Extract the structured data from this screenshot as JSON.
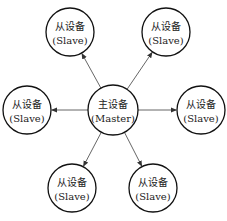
{
  "diagram": {
    "type": "star-topology",
    "master": {
      "label_cn": "主设备",
      "label_en": "(Master)",
      "cx": 113,
      "cy": 110,
      "r": 25
    },
    "slaves": [
      {
        "label_cn": "从设备",
        "label_en": "(Slave)",
        "cx": 70,
        "cy": 32,
        "r": 24
      },
      {
        "label_cn": "从设备",
        "label_en": "(Slave)",
        "cx": 166,
        "cy": 32,
        "r": 24
      },
      {
        "label_cn": "从设备",
        "label_en": "(Slave)",
        "cx": 27,
        "cy": 110,
        "r": 24
      },
      {
        "label_cn": "从设备",
        "label_en": "(Slave)",
        "cx": 201,
        "cy": 110,
        "r": 24
      },
      {
        "label_cn": "从设备",
        "label_en": "(Slave)",
        "cx": 72,
        "cy": 188,
        "r": 24
      },
      {
        "label_cn": "从设备",
        "label_en": "(Slave)",
        "cx": 153,
        "cy": 188,
        "r": 24
      }
    ],
    "edge_color": "#555555",
    "node_stroke": "#111111"
  }
}
